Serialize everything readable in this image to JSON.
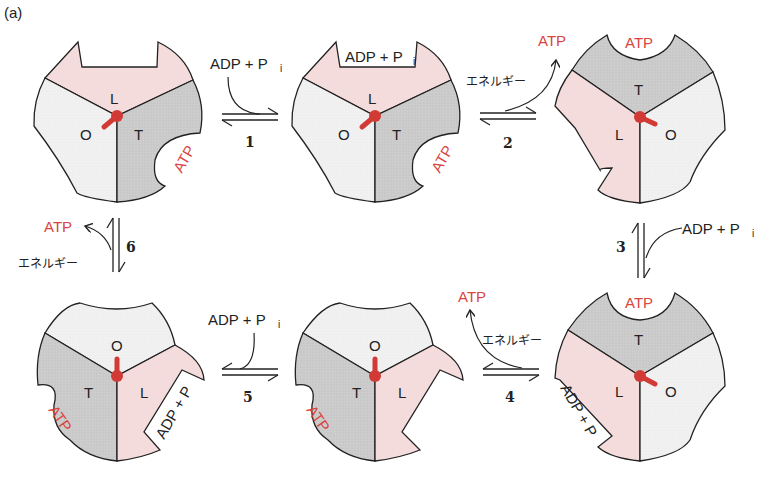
{
  "figure_label": "(a)",
  "colors": {
    "L_subunit": "#f5dcdc",
    "O_subunit": "#f0f0f0",
    "T_subunit": "#cfcfcf",
    "shaft": "#d23a36",
    "atp_text": "#d9453f",
    "outline": "#222222"
  },
  "terms": {
    "atp": "ATP",
    "adp_pi": "ADP + P",
    "pi_sub": "i",
    "energy": "エネルギー"
  },
  "states": [
    {
      "id": 1,
      "labels": {
        "L": "L",
        "O": "O",
        "T": "T"
      },
      "bound": "ATP (in T)"
    },
    {
      "id": 2,
      "labels": {
        "L": "L",
        "O": "O",
        "T": "T"
      },
      "bound": "ADP + Pi (in L), ATP (in T)"
    },
    {
      "id": 3,
      "labels": {
        "L": "L",
        "O": "O",
        "T": "T"
      },
      "bound": "ATP (in T, top)"
    },
    {
      "id": 4,
      "labels": {
        "L": "L",
        "O": "O",
        "T": "T"
      },
      "bound": "ATP (in T), ADP + Pi (in L)"
    },
    {
      "id": 5,
      "labels": {
        "L": "L",
        "O": "O",
        "T": "T"
      },
      "bound": "ATP (in T)"
    },
    {
      "id": 6,
      "labels": {
        "L": "L",
        "O": "O",
        "T": "T"
      },
      "bound": "ATP (in T), ADP + Pi (in L)"
    }
  ],
  "steps": [
    {
      "number": "1",
      "input": "ADP + Pi",
      "output": ""
    },
    {
      "number": "2",
      "input": "エネルギー",
      "output": "ATP"
    },
    {
      "number": "3",
      "input": "ADP + Pi",
      "output": ""
    },
    {
      "number": "4",
      "input": "エネルギー",
      "output": "ATP"
    },
    {
      "number": "5",
      "input": "ADP + Pi",
      "output": ""
    },
    {
      "number": "6",
      "input": "エネルギー",
      "output": "ATP"
    }
  ],
  "labels": {
    "L": "L",
    "O": "O",
    "T": "T",
    "n1": "1",
    "n2": "2",
    "n3": "3",
    "n4": "4",
    "n5": "5",
    "n6": "6"
  }
}
